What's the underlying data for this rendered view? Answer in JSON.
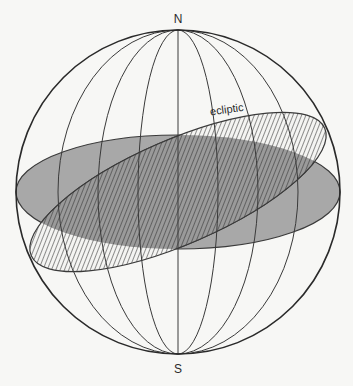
{
  "diagram": {
    "labels": {
      "north": "N",
      "south": "S",
      "ecliptic": "ecliptic"
    },
    "sphere": {
      "cx": 178,
      "cy": 192,
      "r": 162
    },
    "equator_plane": {
      "fill": "#a8a8a8",
      "stroke": "#3a3a3a"
    },
    "ecliptic_plane": {
      "hatch": "#3a3a3a",
      "stroke": "#3a3a3a",
      "tilt_deg": -23.5
    },
    "meridians_rx": [
      40,
      80,
      120
    ],
    "colors": {
      "line": "#3a3a3a",
      "background": "#f7f7f5"
    }
  }
}
